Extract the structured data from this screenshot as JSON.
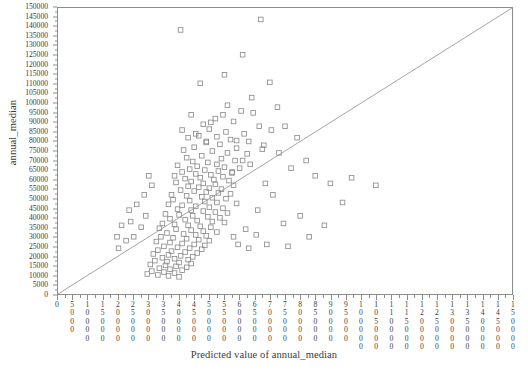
{
  "chart_data": {
    "type": "scatter",
    "title": "",
    "xlabel": "Predicted value of annual_median",
    "ylabel": "annual_median",
    "xlim": [
      0,
      150000
    ],
    "ylim": [
      0,
      150000
    ],
    "xtick_step": 5000,
    "ytick_step": 5000,
    "grid": false,
    "legend": null,
    "marker": "open-square",
    "marker_color": "#8d8d8d",
    "reference_line": {
      "name": "identity-line",
      "type": "line",
      "from": [
        0,
        0
      ],
      "to": [
        150000,
        150000
      ],
      "color": "#9a9a9a"
    },
    "xticks": [
      0,
      5000,
      10000,
      15000,
      20000,
      25000,
      30000,
      35000,
      40000,
      45000,
      50000,
      55000,
      60000,
      65000,
      70000,
      75000,
      80000,
      85000,
      90000,
      95000,
      100000,
      105000,
      110000,
      115000,
      120000,
      125000,
      130000,
      135000,
      140000,
      145000,
      150000
    ],
    "yticks": [
      0,
      5000,
      10000,
      15000,
      20000,
      25000,
      30000,
      35000,
      40000,
      45000,
      50000,
      55000,
      60000,
      65000,
      70000,
      75000,
      80000,
      85000,
      90000,
      95000,
      100000,
      105000,
      110000,
      115000,
      120000,
      125000,
      130000,
      135000,
      140000,
      145000,
      150000
    ],
    "points": [
      [
        40500,
        138500
      ],
      [
        67000,
        144000
      ],
      [
        61000,
        125500
      ],
      [
        55000,
        115000
      ],
      [
        47000,
        110500
      ],
      [
        70000,
        111000
      ],
      [
        64000,
        103000
      ],
      [
        72500,
        98000
      ],
      [
        44000,
        94000
      ],
      [
        52000,
        92000
      ],
      [
        58000,
        90500
      ],
      [
        66500,
        88000
      ],
      [
        50000,
        86500
      ],
      [
        55500,
        85000
      ],
      [
        61500,
        84000
      ],
      [
        46500,
        83000
      ],
      [
        43000,
        82000
      ],
      [
        57000,
        81000
      ],
      [
        63000,
        80000
      ],
      [
        49000,
        79500
      ],
      [
        53500,
        78500
      ],
      [
        68000,
        78000
      ],
      [
        45000,
        77000
      ],
      [
        59000,
        76500
      ],
      [
        41500,
        75500
      ],
      [
        51000,
        75000
      ],
      [
        56000,
        74000
      ],
      [
        62500,
        73500
      ],
      [
        47500,
        72500
      ],
      [
        42500,
        71500
      ],
      [
        54000,
        71000
      ],
      [
        58500,
        70000
      ],
      [
        44500,
        69500
      ],
      [
        49500,
        69000
      ],
      [
        52500,
        68000
      ],
      [
        39500,
        67500
      ],
      [
        46000,
        67000
      ],
      [
        55000,
        66500
      ],
      [
        60000,
        66000
      ],
      [
        43500,
        65500
      ],
      [
        48500,
        65000
      ],
      [
        53000,
        64500
      ],
      [
        41000,
        64000
      ],
      [
        57500,
        63500
      ],
      [
        45500,
        63000
      ],
      [
        50500,
        62500
      ],
      [
        38500,
        62000
      ],
      [
        54500,
        61500
      ],
      [
        47000,
        61000
      ],
      [
        42000,
        60500
      ],
      [
        51500,
        60000
      ],
      [
        56500,
        59500
      ],
      [
        44000,
        59000
      ],
      [
        39000,
        58500
      ],
      [
        48000,
        58000
      ],
      [
        52000,
        57500
      ],
      [
        58000,
        57000
      ],
      [
        43000,
        56500
      ],
      [
        46500,
        56000
      ],
      [
        50000,
        55500
      ],
      [
        54000,
        55000
      ],
      [
        40500,
        54500
      ],
      [
        45000,
        54000
      ],
      [
        49000,
        53500
      ],
      [
        53000,
        53000
      ],
      [
        57000,
        52500
      ],
      [
        37500,
        52000
      ],
      [
        42500,
        51500
      ],
      [
        47500,
        51000
      ],
      [
        51000,
        50500
      ],
      [
        55500,
        50000
      ],
      [
        38000,
        49500
      ],
      [
        43500,
        49000
      ],
      [
        48500,
        48500
      ],
      [
        52500,
        48000
      ],
      [
        59000,
        47500
      ],
      [
        36500,
        47000
      ],
      [
        41000,
        46500
      ],
      [
        45500,
        46000
      ],
      [
        50000,
        45500
      ],
      [
        54500,
        45000
      ],
      [
        39500,
        44500
      ],
      [
        44000,
        44000
      ],
      [
        48000,
        43500
      ],
      [
        52000,
        43000
      ],
      [
        56000,
        42500
      ],
      [
        35500,
        42000
      ],
      [
        40000,
        41500
      ],
      [
        44500,
        41000
      ],
      [
        49500,
        40500
      ],
      [
        53500,
        40000
      ],
      [
        37000,
        39500
      ],
      [
        42000,
        39000
      ],
      [
        46000,
        38500
      ],
      [
        51000,
        38000
      ],
      [
        55000,
        37500
      ],
      [
        34500,
        37000
      ],
      [
        38500,
        36500
      ],
      [
        43000,
        36000
      ],
      [
        47000,
        35500
      ],
      [
        50500,
        35000
      ],
      [
        33500,
        34500
      ],
      [
        39000,
        34000
      ],
      [
        44000,
        33500
      ],
      [
        48000,
        33000
      ],
      [
        52500,
        32500
      ],
      [
        36000,
        32000
      ],
      [
        41500,
        31500
      ],
      [
        45500,
        31000
      ],
      [
        49000,
        30500
      ],
      [
        34000,
        30000
      ],
      [
        38000,
        29500
      ],
      [
        42500,
        29000
      ],
      [
        46500,
        28500
      ],
      [
        50000,
        28000
      ],
      [
        32500,
        27500
      ],
      [
        37000,
        27000
      ],
      [
        41000,
        26500
      ],
      [
        45000,
        26000
      ],
      [
        48500,
        25500
      ],
      [
        35000,
        25000
      ],
      [
        39500,
        24500
      ],
      [
        43500,
        24000
      ],
      [
        47500,
        23500
      ],
      [
        33000,
        23000
      ],
      [
        37500,
        22500
      ],
      [
        42000,
        22000
      ],
      [
        46000,
        21500
      ],
      [
        31500,
        21000
      ],
      [
        36500,
        20500
      ],
      [
        40500,
        20000
      ],
      [
        44500,
        19500
      ],
      [
        34500,
        19000
      ],
      [
        38500,
        18500
      ],
      [
        43000,
        18000
      ],
      [
        32000,
        17500
      ],
      [
        36000,
        17000
      ],
      [
        40000,
        16500
      ],
      [
        44000,
        16000
      ],
      [
        30500,
        15500
      ],
      [
        35500,
        15000
      ],
      [
        39000,
        14500
      ],
      [
        42500,
        14000
      ],
      [
        33500,
        13500
      ],
      [
        37000,
        13000
      ],
      [
        41000,
        12500
      ],
      [
        31000,
        12000
      ],
      [
        35000,
        11500
      ],
      [
        38500,
        11000
      ],
      [
        29500,
        10500
      ],
      [
        33000,
        10000
      ],
      [
        36500,
        9500
      ],
      [
        40000,
        9000
      ],
      [
        28500,
        52000
      ],
      [
        26000,
        47000
      ],
      [
        24000,
        38000
      ],
      [
        29000,
        41000
      ],
      [
        27500,
        35000
      ],
      [
        31000,
        57000
      ],
      [
        25000,
        30000
      ],
      [
        22500,
        28000
      ],
      [
        30000,
        62000
      ],
      [
        23500,
        44000
      ],
      [
        75000,
        88000
      ],
      [
        79000,
        82000
      ],
      [
        73000,
        74000
      ],
      [
        82000,
        70000
      ],
      [
        77000,
        66000
      ],
      [
        85000,
        62000
      ],
      [
        68500,
        58000
      ],
      [
        71000,
        52000
      ],
      [
        90000,
        58000
      ],
      [
        66000,
        44000
      ],
      [
        80000,
        41000
      ],
      [
        74500,
        37000
      ],
      [
        88000,
        36000
      ],
      [
        83000,
        30000
      ],
      [
        69000,
        26000
      ],
      [
        63000,
        24000
      ],
      [
        76000,
        25000
      ],
      [
        97000,
        61000
      ],
      [
        94000,
        48000
      ],
      [
        105000,
        57000
      ],
      [
        62000,
        34000
      ],
      [
        58000,
        30000
      ],
      [
        65500,
        31000
      ],
      [
        59500,
        26000
      ],
      [
        21000,
        36000
      ],
      [
        20000,
        24000
      ],
      [
        19500,
        30000
      ],
      [
        60500,
        96000
      ],
      [
        48000,
        89000
      ],
      [
        64500,
        95000
      ],
      [
        41000,
        86000
      ],
      [
        70500,
        86000
      ],
      [
        56000,
        99000
      ],
      [
        52500,
        82500
      ],
      [
        59000,
        80500
      ],
      [
        45500,
        84000
      ],
      [
        49000,
        80000
      ],
      [
        67500,
        76000
      ],
      [
        61000,
        70000
      ],
      [
        63500,
        68000
      ],
      [
        57500,
        64000
      ],
      [
        50500,
        90000
      ],
      [
        54500,
        94000
      ]
    ]
  },
  "axis": {
    "x_title": "Predicted value of annual_median",
    "y_title": "annual_median"
  }
}
